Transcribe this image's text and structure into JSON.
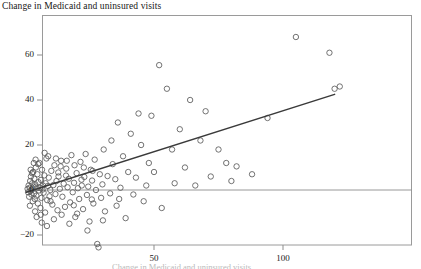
{
  "figure": {
    "title": "Change in Medicaid and uninsured visits",
    "xaxis_caption_partial": "Change in Medicaid and uninsured visits"
  },
  "chart_data": {
    "type": "scatter",
    "title": "Change in Medicaid and uninsured visits",
    "xlabel": "",
    "ylabel": "",
    "xlim": [
      -7,
      143
    ],
    "ylim": [
      -27,
      72
    ],
    "grid": false,
    "legend": "none",
    "xticks": [
      50,
      100
    ],
    "xticklabels": [
      "50",
      "100"
    ],
    "yticks": [
      -20,
      0,
      20,
      40,
      60
    ],
    "yticklabels": [
      "-20",
      "0",
      "20",
      "40",
      "60"
    ],
    "marker": "open-circle",
    "marker_color": "#5a5a5a",
    "reference_line": {
      "orientation": "horizontal",
      "y": 0,
      "color": "#8d8d8d"
    },
    "fit_line": {
      "type": "linear",
      "color": "#3a3a3a",
      "x_start": 0.5,
      "y_start": -1.0,
      "x_end": 120.0,
      "y_end": 42.5
    },
    "points": [
      [
        1.0,
        0.5
      ],
      [
        1.2,
        -1.0
      ],
      [
        1.4,
        2.0
      ],
      [
        1.6,
        -3.0
      ],
      [
        1.8,
        1.0
      ],
      [
        2.0,
        4.0
      ],
      [
        2.1,
        -0.5
      ],
      [
        2.3,
        6.0
      ],
      [
        2.5,
        -2.0
      ],
      [
        2.6,
        0.0
      ],
      [
        2.8,
        3.0
      ],
      [
        3.0,
        -5.0
      ],
      [
        3.1,
        8.0
      ],
      [
        3.3,
        1.5
      ],
      [
        3.5,
        -1.5
      ],
      [
        3.6,
        5.0
      ],
      [
        3.8,
        -4.0
      ],
      [
        4.0,
        2.5
      ],
      [
        4.2,
        10.0
      ],
      [
        4.4,
        -2.5
      ],
      [
        4.6,
        0.8
      ],
      [
        4.8,
        7.0
      ],
      [
        5.0,
        -6.0
      ],
      [
        5.2,
        3.5
      ],
      [
        5.4,
        -0.2
      ],
      [
        5.6,
        12.0
      ],
      [
        5.8,
        1.0
      ],
      [
        6.0,
        -8.0
      ],
      [
        6.2,
        4.5
      ],
      [
        6.4,
        -3.5
      ],
      [
        6.6,
        9.0
      ],
      [
        6.8,
        0.2
      ],
      [
        7.0,
        2.0
      ],
      [
        7.2,
        -1.2
      ],
      [
        7.5,
        6.5
      ],
      [
        7.8,
        -10.0
      ],
      [
        8.0,
        3.0
      ],
      [
        8.3,
        14.0
      ],
      [
        8.6,
        -4.5
      ],
      [
        8.9,
        1.8
      ],
      [
        9.2,
        5.5
      ],
      [
        9.5,
        -2.8
      ],
      [
        9.8,
        0.0
      ],
      [
        10.2,
        8.5
      ],
      [
        10.6,
        -6.5
      ],
      [
        11.0,
        2.2
      ],
      [
        11.4,
        11.0
      ],
      [
        11.8,
        -1.8
      ],
      [
        12.2,
        4.0
      ],
      [
        12.6,
        -9.0
      ],
      [
        13.0,
        6.0
      ],
      [
        13.5,
        0.5
      ],
      [
        14.0,
        13.0
      ],
      [
        14.5,
        -3.0
      ],
      [
        15.0,
        2.8
      ],
      [
        15.5,
        -7.5
      ],
      [
        16.0,
        9.5
      ],
      [
        16.5,
        1.2
      ],
      [
        17.0,
        5.0
      ],
      [
        17.5,
        -5.5
      ],
      [
        18.0,
        15.5
      ],
      [
        18.5,
        -1.0
      ],
      [
        19.0,
        3.2
      ],
      [
        19.5,
        -12.0
      ],
      [
        20.0,
        7.5
      ],
      [
        20.5,
        0.8
      ],
      [
        21.0,
        -4.0
      ],
      [
        21.5,
        12.5
      ],
      [
        22.0,
        2.0
      ],
      [
        22.5,
        -8.5
      ],
      [
        23.0,
        5.8
      ],
      [
        23.5,
        16.0
      ],
      [
        24.0,
        -2.2
      ],
      [
        24.5,
        1.5
      ],
      [
        25.0,
        -14.0
      ],
      [
        25.5,
        9.0
      ],
      [
        26.0,
        4.2
      ],
      [
        26.5,
        -6.0
      ],
      [
        27.0,
        13.5
      ],
      [
        27.5,
        0.0
      ],
      [
        28.0,
        -24.0
      ],
      [
        28.5,
        -25.5
      ],
      [
        29.0,
        7.0
      ],
      [
        29.5,
        -3.5
      ],
      [
        30.0,
        2.5
      ],
      [
        30.5,
        18.0
      ],
      [
        31.0,
        -9.5
      ],
      [
        32.0,
        6.2
      ],
      [
        33.0,
        -1.5
      ],
      [
        34.0,
        11.5
      ],
      [
        35.0,
        4.8
      ],
      [
        35.5,
        -7.0
      ],
      [
        36.0,
        30.0
      ],
      [
        37.0,
        1.0
      ],
      [
        38.0,
        15.0
      ],
      [
        39.0,
        -12.5
      ],
      [
        40.0,
        8.0
      ],
      [
        41.0,
        25.0
      ],
      [
        42.0,
        -2.0
      ],
      [
        43.0,
        5.5
      ],
      [
        44.0,
        34.0
      ],
      [
        45.0,
        20.0
      ],
      [
        46.0,
        -5.0
      ],
      [
        47.0,
        2.0
      ],
      [
        48.0,
        12.0
      ],
      [
        49.0,
        33.0
      ],
      [
        50.0,
        8.0
      ],
      [
        52.0,
        55.5
      ],
      [
        53.0,
        -8.0
      ],
      [
        55.0,
        45.0
      ],
      [
        57.0,
        18.0
      ],
      [
        58.0,
        3.0
      ],
      [
        60.0,
        27.0
      ],
      [
        62.0,
        10.0
      ],
      [
        64.0,
        40.0
      ],
      [
        66.0,
        2.0
      ],
      [
        68.0,
        22.0
      ],
      [
        70.0,
        35.0
      ],
      [
        72.0,
        6.0
      ],
      [
        75.0,
        18.0
      ],
      [
        78.0,
        12.0
      ],
      [
        80.0,
        4.0
      ],
      [
        82.0,
        10.5
      ],
      [
        88.0,
        7.0
      ],
      [
        94.0,
        32.0
      ],
      [
        105.0,
        68.0
      ],
      [
        118.0,
        61.0
      ],
      [
        120.0,
        45.0
      ],
      [
        122.0,
        46.0
      ],
      [
        7.6,
        16.5
      ],
      [
        9.0,
        15.0
      ],
      [
        12.0,
        14.0
      ],
      [
        13.8,
        10.5
      ],
      [
        16.2,
        13.0
      ],
      [
        19.2,
        11.0
      ],
      [
        22.8,
        10.0
      ],
      [
        26.2,
        8.5
      ],
      [
        4.5,
        -12.0
      ],
      [
        6.5,
        -14.5
      ],
      [
        8.5,
        -16.0
      ],
      [
        11.2,
        -13.0
      ],
      [
        14.2,
        -11.0
      ],
      [
        17.2,
        -15.0
      ],
      [
        20.2,
        -10.5
      ],
      [
        24.2,
        -18.0
      ],
      [
        30.2,
        -13.5
      ],
      [
        3.4,
        12.0
      ],
      [
        2.2,
        9.0
      ],
      [
        5.1,
        11.5
      ],
      [
        1.9,
        -7.0
      ],
      [
        3.9,
        -9.5
      ],
      [
        2.7,
        7.5
      ],
      [
        6.1,
        -11.0
      ],
      [
        4.1,
        13.5
      ],
      [
        9.9,
        -5.0
      ],
      [
        12.9,
        7.8
      ],
      [
        15.9,
        6.4
      ],
      [
        18.9,
        -6.8
      ],
      [
        21.9,
        4.6
      ],
      [
        25.9,
        -4.2
      ],
      [
        33.5,
        22.0
      ],
      [
        36.5,
        -4.0
      ]
    ]
  }
}
